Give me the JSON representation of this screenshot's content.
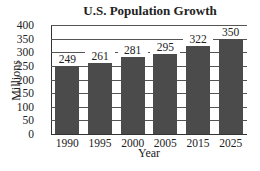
{
  "chart_data": {
    "type": "bar",
    "title": "U.S. Population Growth",
    "xlabel": "Year",
    "ylabel": "Millions",
    "categories": [
      "1990",
      "1995",
      "2000",
      "2005",
      "2015",
      "2025"
    ],
    "values": [
      249,
      261,
      281,
      295,
      322,
      350
    ],
    "data_labels": [
      "249",
      "261",
      "281",
      "295",
      "322",
      "350"
    ],
    "ylim": [
      0,
      400
    ],
    "yticks": [
      "0",
      "50",
      "100",
      "150",
      "200",
      "250",
      "300",
      "350",
      "400"
    ],
    "grid": true,
    "legend": null,
    "bar_color": "#4b4b4b"
  }
}
